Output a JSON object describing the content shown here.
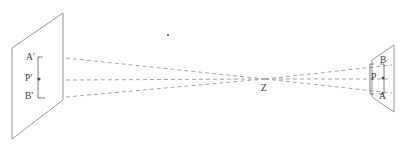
{
  "figure": {
    "kind": "geometric-optics-diagram",
    "background_color": "#ffffff",
    "line_color": "#8a8a8a",
    "dashed_line_color": "#9a9a9a",
    "label_color": "#3a3a3a",
    "width": 400,
    "height": 151
  },
  "labels": {
    "a_prime": "A'",
    "p_prime": "P'",
    "b_prime": "B'",
    "z": "Z",
    "b": "B",
    "p": "P",
    "a": "A"
  },
  "geometry": {
    "left_plane": {
      "name": "object-plane",
      "points": "12,48 63,13 63,100 12,139"
    },
    "right_plane": {
      "name": "image-plane",
      "points": "372,60 394,45 394,112 372,97"
    },
    "convergence_point": {
      "x": 265,
      "y": 79
    },
    "rays": [
      {
        "name": "ray-a",
        "x1": 66,
        "y1": 58,
        "x2": 265,
        "y2": 79,
        "x3": 392,
        "y3": 93
      },
      {
        "name": "ray-p",
        "x1": 66,
        "y1": 80,
        "x2": 265,
        "y2": 79,
        "x3": 390,
        "y3": 79
      },
      {
        "name": "ray-b",
        "x1": 66,
        "y1": 97,
        "x2": 265,
        "y2": 79,
        "x3": 392,
        "y3": 65
      }
    ],
    "left_bracket": {
      "x": 38,
      "y_top": 58,
      "y_bottom": 97,
      "tick": 5
    },
    "right_bracket": {
      "x": 384,
      "y_top": 65,
      "y_bottom": 93,
      "tick": 4
    },
    "stray_dot": {
      "x": 168,
      "y": 35
    }
  },
  "label_positions": {
    "a_prime": {
      "left": 26,
      "top": 53
    },
    "p_prime": {
      "left": 26,
      "top": 75
    },
    "b_prime": {
      "left": 26,
      "top": 92
    },
    "z": {
      "left": 261,
      "top": 84
    },
    "b": {
      "left": 380,
      "top": 56
    },
    "p": {
      "left": 372,
      "top": 74
    },
    "a": {
      "left": 379,
      "top": 92
    }
  }
}
